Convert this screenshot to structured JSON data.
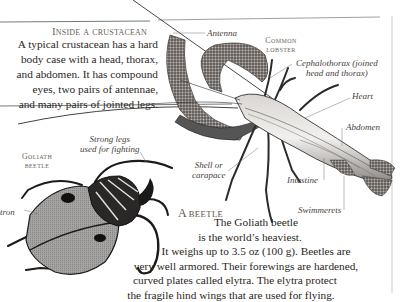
{
  "crustacean_section": {
    "heading": "Inside a crustacean",
    "lines": [
      "A typical crustacean has a hard",
      "body case with a head, thorax,",
      "and abdomen. It has compound",
      "eyes, two pairs of antennae,",
      "and many pairs of jointed legs."
    ]
  },
  "lobster_diagram": {
    "title_line1": "Common",
    "title_line2": "lobster",
    "labels": {
      "antenna": "Antenna",
      "cephalothorax_1": "Cephalothorax (joined",
      "cephalothorax_2": "head and thorax)",
      "heart": "Heart",
      "abdomen": "Abdomen",
      "shell_1": "Shell or",
      "shell_2": "carapace",
      "intestine": "Intestine",
      "swimmerets": "Swimmerets"
    }
  },
  "beetle_diagram": {
    "title_line1": "Goliath",
    "title_line2": "beetle",
    "labels": {
      "strong_legs_1": "Strong legs",
      "strong_legs_2": "used for fighting",
      "elytron": "Elytron"
    }
  },
  "beetle_section": {
    "heading_initial": "A",
    "heading_rest": "beetle",
    "lines": [
      "The Goliath beetle",
      "is the world’s heaviest.",
      "It weighs up to 3.5 oz (100 g). Beetles are",
      "very well armored. Their forewings are hardened,",
      "curved plates called elytra. The elytra protect",
      "the fragile hind wings that are used for flying."
    ]
  }
}
